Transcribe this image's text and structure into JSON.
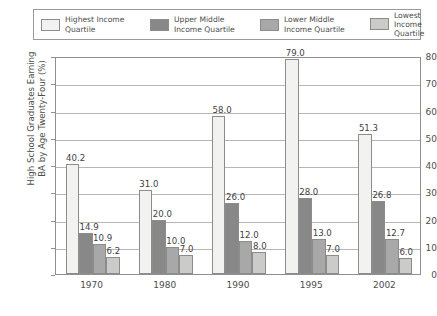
{
  "chart_data": {
    "type": "bar",
    "title": "",
    "xlabel": "",
    "ylabel": "High School Graduates Earning\nBA by Age Twenty-Four (%)",
    "ylim": [
      0,
      80
    ],
    "yticks": [
      0,
      10,
      20,
      30,
      40,
      50,
      60,
      70,
      80
    ],
    "grid": true,
    "legend_position": "top",
    "categories": [
      "1970",
      "1980",
      "1990",
      "1995",
      "2002"
    ],
    "series": [
      {
        "name": "Highest Income Quartile",
        "legend_line1": "Highest Income",
        "legend_line2": "Quartile",
        "color": "#f2f2f0",
        "values": [
          40.2,
          31.0,
          58.0,
          79.0,
          51.3
        ],
        "labels": [
          "40.2",
          "31.0",
          "58.0",
          "79.0",
          "51.3"
        ]
      },
      {
        "name": "Upper Middle Income Quartile",
        "legend_line1": "Upper Middle",
        "legend_line2": "Income Quartile",
        "color": "#888888",
        "values": [
          14.9,
          20.0,
          26.0,
          28.0,
          26.8
        ],
        "labels": [
          "14.9",
          "20.0",
          "26.0",
          "28.0",
          "26.8"
        ]
      },
      {
        "name": "Lower Middle Income Quartile",
        "legend_line1": "Lower Middle",
        "legend_line2": "Income Quartile",
        "color": "#a8a8a8",
        "values": [
          10.9,
          10.0,
          12.0,
          13.0,
          12.7
        ],
        "labels": [
          "10.9",
          "10.0",
          "12.0",
          "13.0",
          "12.7"
        ]
      },
      {
        "name": "Lowest Income Quartile",
        "legend_line1": "Lowest Income",
        "legend_line2": "Quartile",
        "color": "#cbcbc9",
        "values": [
          6.2,
          7.0,
          8.0,
          7.0,
          6.0
        ],
        "labels": [
          "6.2",
          "7.0",
          "8.0",
          "7.0",
          "6.0"
        ]
      }
    ]
  },
  "caption": ""
}
